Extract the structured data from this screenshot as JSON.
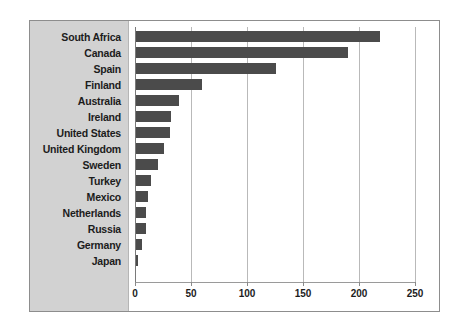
{
  "chart_data": {
    "type": "bar",
    "orientation": "horizontal",
    "title": "",
    "subtitle": "",
    "xlabel": "",
    "ylabel": "",
    "xlim": [
      0,
      250
    ],
    "ylim": null,
    "grid": true,
    "legend": null,
    "legend_position": "none",
    "xticks": [
      0,
      50,
      100,
      150,
      200,
      250
    ],
    "xtick_labels": [
      "0",
      "50",
      "100",
      "150",
      "200",
      "250"
    ],
    "categories": [
      "South Africa",
      "Canada",
      "Spain",
      "Finland",
      "Australia",
      "Ireland",
      "United States",
      "United Kingdom",
      "Sweden",
      "Turkey",
      "Mexico",
      "Netherlands",
      "Russia",
      "Germany",
      "Japan"
    ],
    "values": [
      218,
      189,
      125,
      59,
      38,
      31,
      30,
      25,
      20,
      13,
      11,
      9,
      9,
      5,
      2
    ],
    "bar_color": "#4b4b4b",
    "panel_color": "#d2d2d2",
    "plot_background": "#ffffff",
    "gridline_color": "#b9b9b9",
    "frame_color": "#8d8d8d"
  }
}
